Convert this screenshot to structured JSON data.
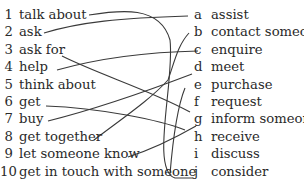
{
  "left_items": [
    {
      "num": "1",
      "text": "talk about"
    },
    {
      "num": "2",
      "text": "ask"
    },
    {
      "num": "3",
      "text": "ask for"
    },
    {
      "num": "4",
      "text": "help"
    },
    {
      "num": "5",
      "text": "think about"
    },
    {
      "num": "6",
      "text": "get"
    },
    {
      "num": "7",
      "text": "buy"
    },
    {
      "num": "8",
      "text": "get together"
    },
    {
      "num": "9",
      "text": "let someone know"
    },
    {
      "num": "10",
      "text": "get in touch with someone"
    }
  ],
  "right_items": [
    {
      "letter": "a",
      "text": "assist"
    },
    {
      "letter": "b",
      "text": "contact someone"
    },
    {
      "letter": "c",
      "text": "enquire"
    },
    {
      "letter": "d",
      "text": "meet"
    },
    {
      "letter": "e",
      "text": "purchase"
    },
    {
      "letter": "f",
      "text": "request"
    },
    {
      "letter": "g",
      "text": "inform someone"
    },
    {
      "letter": "h",
      "text": "receive"
    },
    {
      "letter": "i",
      "text": "discuss"
    },
    {
      "letter": "j",
      "text": "consider"
    }
  ],
  "matches": [
    {
      "from": "1",
      "to": "i"
    },
    {
      "from": "2",
      "to": "a"
    },
    {
      "from": "3",
      "to": "f"
    },
    {
      "from": "4",
      "to": "c"
    },
    {
      "from": "6",
      "to": "h"
    },
    {
      "from": "7",
      "to": "d"
    },
    {
      "from": "8",
      "to": "e"
    },
    {
      "from": "9",
      "to": "g"
    },
    {
      "from": "10",
      "to": "b"
    }
  ]
}
